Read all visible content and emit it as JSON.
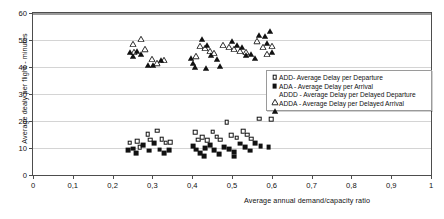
{
  "chart_data": {
    "type": "scatter",
    "title": "",
    "xlabel": "Average annual demand/capacity ratio",
    "ylabel": "Average dealy per flight - minutes",
    "xlim": [
      0,
      1
    ],
    "ylim": [
      0,
      60
    ],
    "xticks": [
      "0",
      "0,1",
      "0,2",
      "0,3",
      "0,4",
      "0,5",
      "0,6",
      "0,7",
      "0,8",
      "0,9",
      "1"
    ],
    "xtick_values": [
      0,
      0.1,
      0.2,
      0.3,
      0.4,
      0.5,
      0.6,
      0.7,
      0.8,
      0.9,
      1
    ],
    "yticks": [
      "0",
      "10",
      "20",
      "30",
      "40",
      "50",
      "60"
    ],
    "ytick_values": [
      0,
      10,
      20,
      30,
      40,
      50,
      60
    ],
    "grid": "horizontal",
    "legend_position": "center-right-inside",
    "series": [
      {
        "name": "ADD- Average Delay per Departure",
        "abbr": "ADD",
        "marker": "square-open",
        "color": "#111111",
        "points": [
          [
            0.243,
            12.0
          ],
          [
            0.262,
            12.6
          ],
          [
            0.268,
            10.2
          ],
          [
            0.288,
            15.2
          ],
          [
            0.295,
            13.1
          ],
          [
            0.312,
            16.4
          ],
          [
            0.323,
            13.2
          ],
          [
            0.333,
            12.0
          ],
          [
            0.345,
            12.2
          ],
          [
            0.408,
            15.8
          ],
          [
            0.415,
            13.0
          ],
          [
            0.425,
            14.0
          ],
          [
            0.437,
            12.8
          ],
          [
            0.452,
            16.0
          ],
          [
            0.462,
            14.2
          ],
          [
            0.47,
            13.0
          ],
          [
            0.487,
            19.6
          ],
          [
            0.498,
            14.8
          ],
          [
            0.512,
            13.8
          ],
          [
            0.528,
            16.2
          ],
          [
            0.538,
            15.0
          ],
          [
            0.548,
            13.4
          ],
          [
            0.568,
            20.8
          ],
          [
            0.598,
            20.6
          ]
        ]
      },
      {
        "name": "ADA - Average Delay per Arrival",
        "abbr": "ADA",
        "marker": "square-filled",
        "color": "#111111",
        "points": [
          [
            0.238,
            9.2
          ],
          [
            0.252,
            9.8
          ],
          [
            0.26,
            8.2
          ],
          [
            0.277,
            11.0
          ],
          [
            0.292,
            9.0
          ],
          [
            0.305,
            11.8
          ],
          [
            0.318,
            9.4
          ],
          [
            0.33,
            8.0
          ],
          [
            0.342,
            9.2
          ],
          [
            0.402,
            10.8
          ],
          [
            0.41,
            9.4
          ],
          [
            0.42,
            8.2
          ],
          [
            0.432,
            10.0
          ],
          [
            0.445,
            11.2
          ],
          [
            0.455,
            9.2
          ],
          [
            0.468,
            7.6
          ],
          [
            0.48,
            10.4
          ],
          [
            0.492,
            9.6
          ],
          [
            0.505,
            8.4
          ],
          [
            0.52,
            11.6
          ],
          [
            0.532,
            10.2
          ],
          [
            0.545,
            9.0
          ],
          [
            0.558,
            11.8
          ],
          [
            0.572,
            10.6
          ],
          [
            0.592,
            10.4
          ],
          [
            0.505,
            6.8
          ],
          [
            0.43,
            7.0
          ]
        ]
      },
      {
        "name": "ADDD - Average Delay per Delayed Departure",
        "abbr": "ADDD",
        "marker": "triangle-open",
        "color": "#111111",
        "points": [
          [
            0.25,
            51.4
          ],
          [
            0.272,
            53.2
          ],
          [
            0.255,
            48.6
          ],
          [
            0.282,
            49.4
          ],
          [
            0.3,
            45.8
          ],
          [
            0.312,
            44.2
          ],
          [
            0.33,
            45.6
          ],
          [
            0.42,
            50.8
          ],
          [
            0.432,
            50.0
          ],
          [
            0.445,
            49.0
          ],
          [
            0.455,
            48.2
          ],
          [
            0.41,
            46.8
          ],
          [
            0.478,
            51.2
          ],
          [
            0.492,
            50.4
          ],
          [
            0.505,
            49.6
          ],
          [
            0.52,
            49.0
          ],
          [
            0.535,
            48.6
          ],
          [
            0.562,
            52.4
          ],
          [
            0.578,
            50.2
          ],
          [
            0.588,
            47.6
          ],
          [
            0.6,
            50.6
          ]
        ]
      },
      {
        "name": "ADDA - Average Delay per Delayed Arrival",
        "abbr": "ADDA",
        "marker": "triangle-filled",
        "color": "#111111",
        "points": [
          [
            0.243,
            48.4
          ],
          [
            0.252,
            47.0
          ],
          [
            0.262,
            48.8
          ],
          [
            0.272,
            47.8
          ],
          [
            0.29,
            43.8
          ],
          [
            0.302,
            43.6
          ],
          [
            0.322,
            45.4
          ],
          [
            0.398,
            46.2
          ],
          [
            0.402,
            44.4
          ],
          [
            0.408,
            43.0
          ],
          [
            0.425,
            53.2
          ],
          [
            0.438,
            51.0
          ],
          [
            0.448,
            47.4
          ],
          [
            0.462,
            46.0
          ],
          [
            0.435,
            42.6
          ],
          [
            0.47,
            43.4
          ],
          [
            0.5,
            52.6
          ],
          [
            0.512,
            51.2
          ],
          [
            0.524,
            50.4
          ],
          [
            0.536,
            47.2
          ],
          [
            0.548,
            47.8
          ],
          [
            0.558,
            46.4
          ],
          [
            0.568,
            54.6
          ],
          [
            0.582,
            54.2
          ],
          [
            0.596,
            56.4
          ],
          [
            0.588,
            51.8
          ],
          [
            0.6,
            48.4
          ]
        ]
      }
    ]
  },
  "legend": {
    "entries": [
      {
        "key": "square-open",
        "label": "ADD- Average Delay per Departure"
      },
      {
        "key": "square-filled",
        "label": "ADA - Average Delay per Arrival"
      },
      {
        "key": "triangle-open",
        "label": "ADDD - Average Delay per Delayed Departure"
      },
      {
        "key": "triangle-filled",
        "label": "ADDA - Average Delay per Delayed Arrival"
      }
    ]
  },
  "colors": {
    "marker": "#111111",
    "grid": "#d4d4d4",
    "axis": "#4d4d4d",
    "legend_border": "#9a9a9a",
    "background": "#ffffff"
  }
}
